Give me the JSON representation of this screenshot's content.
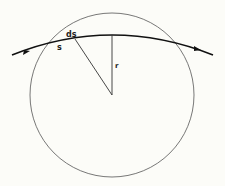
{
  "figure": {
    "labels": {
      "arc_element": "ds",
      "arc_length": "s",
      "radius": "r"
    },
    "colors": {
      "background": "#fcfcf8",
      "stroke": "#333333",
      "trajectory": "#111111"
    },
    "elements": [
      "circle",
      "curved trajectory with direction arrows",
      "radius line r",
      "line from center to ds"
    ]
  }
}
